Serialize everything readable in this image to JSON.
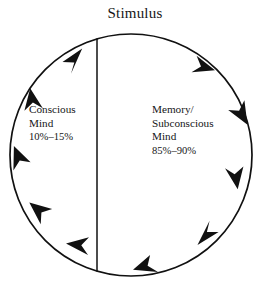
{
  "diagram": {
    "type": "cycle",
    "title": "Stimulus",
    "flow_direction": "clockwise",
    "geometry": {
      "center_x": 131,
      "center_y": 155,
      "radius": 121,
      "divider_x": 97,
      "stroke_color": "#111111",
      "background_color": "#ffffff"
    },
    "segments": [
      {
        "id": "conscious",
        "side": "left",
        "lines": [
          "Conscious",
          "Mind"
        ],
        "percent": "10%–15%",
        "share_low": 10,
        "share_high": 15
      },
      {
        "id": "subconscious",
        "side": "right",
        "lines": [
          "Memory/",
          "Subconscious",
          "Mind"
        ],
        "percent": "85%–90%",
        "share_low": 85,
        "share_high": 90
      }
    ],
    "arrow_count": 8,
    "arrow_angles_deg": [
      118,
      152,
      200,
      236,
      270,
      305,
      340,
      28
    ]
  }
}
